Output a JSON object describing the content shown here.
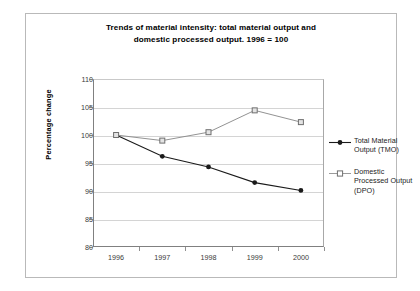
{
  "chart_data": {
    "type": "line",
    "title": "Trends of material intensity: total material output and domestic processed output. 1996 = 100",
    "title_lines": [
      "Trends of material intensity: total material output and",
      "domestic processed output. 1996 = 100"
    ],
    "xlabel": "",
    "ylabel": "Percentage change",
    "categories": [
      "1996",
      "1997",
      "1998",
      "1999",
      "2000"
    ],
    "x": [
      1996,
      1997,
      1998,
      1999,
      2000
    ],
    "ylim": [
      80,
      110
    ],
    "y_ticks": [
      "110",
      "105",
      "100",
      "95",
      "90",
      "85",
      "80"
    ],
    "y_tick_values": [
      110,
      105,
      100,
      95,
      90,
      85,
      80
    ],
    "grid": true,
    "legend_position": "right",
    "series": [
      {
        "name": "Total Material Output (TMO)",
        "name_lines": [
          "Total Material",
          "Output (TMO)"
        ],
        "marker": "filled-circle",
        "color": "#1a1a1a",
        "values": [
          100.0,
          96.2,
          94.3,
          91.5,
          90.1
        ]
      },
      {
        "name": "Domestic Processed Output (DPO)",
        "name_lines": [
          "Domestic",
          "Processed Output",
          "(DPO)"
        ],
        "marker": "open-square",
        "color": "#8c8c8c",
        "values": [
          100.0,
          99.0,
          100.5,
          104.4,
          102.3
        ]
      }
    ]
  },
  "colors": {
    "frame_border": "#b9b9b9",
    "axis": "#808080",
    "gridline": "#d4d4d4",
    "tmo": "#1a1a1a",
    "dpo": "#8c8c8c",
    "background": "#ffffff"
  }
}
